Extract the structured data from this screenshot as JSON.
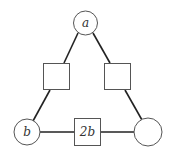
{
  "diagram": {
    "type": "magic-triangle",
    "colors": {
      "line": "#222222",
      "node_stroke": "#555555",
      "text": "#333333",
      "background": "#ffffff"
    },
    "nodes": [
      {
        "id": "top-circle",
        "shape": "circle",
        "label": "a"
      },
      {
        "id": "left-square",
        "shape": "square",
        "label": ""
      },
      {
        "id": "right-square",
        "shape": "square",
        "label": ""
      },
      {
        "id": "bottom-left-circle",
        "shape": "circle",
        "label": "b"
      },
      {
        "id": "bottom-square",
        "shape": "square",
        "label": "2b"
      },
      {
        "id": "bottom-right-circle",
        "shape": "circle",
        "label": ""
      }
    ],
    "edges": [
      [
        "top-circle",
        "left-square"
      ],
      [
        "left-square",
        "bottom-left-circle"
      ],
      [
        "top-circle",
        "right-square"
      ],
      [
        "right-square",
        "bottom-right-circle"
      ],
      [
        "bottom-left-circle",
        "bottom-square"
      ],
      [
        "bottom-square",
        "bottom-right-circle"
      ]
    ]
  }
}
